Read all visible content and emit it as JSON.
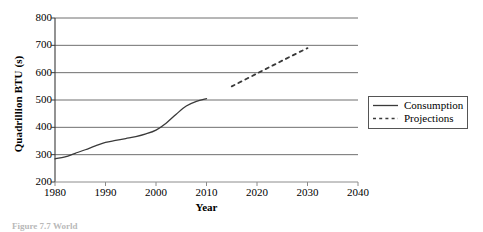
{
  "chart_data": {
    "type": "line",
    "title": "",
    "xlabel": "Year",
    "ylabel": "Quadrillion BTU (s)",
    "xlim": [
      1980,
      2040
    ],
    "ylim": [
      200,
      800
    ],
    "xticks": [
      1980,
      1990,
      2000,
      2010,
      2020,
      2030,
      2040
    ],
    "yticks": [
      200,
      300,
      400,
      500,
      600,
      700,
      800
    ],
    "grid": "horizontal",
    "legend_position": "right",
    "series": [
      {
        "name": "Consumption",
        "style": "solid",
        "color": "#3a3a3a",
        "x": [
          1980,
          1982,
          1984,
          1986,
          1988,
          1990,
          1992,
          1994,
          1996,
          1998,
          2000,
          2002,
          2004,
          2006,
          2008,
          2010
        ],
        "values": [
          285,
          292,
          305,
          318,
          332,
          345,
          352,
          359,
          366,
          376,
          390,
          415,
          448,
          478,
          495,
          505
        ]
      },
      {
        "name": "Projections",
        "style": "dashed",
        "color": "#3a3a3a",
        "x": [
          2015,
          2020,
          2025,
          2030
        ],
        "values": [
          550,
          597,
          644,
          690
        ]
      }
    ],
    "legend": [
      {
        "label": "Consumption",
        "style": "solid"
      },
      {
        "label": "Projections",
        "style": "dashed"
      }
    ]
  },
  "caption": {
    "text": "Figure 7.7  World"
  }
}
